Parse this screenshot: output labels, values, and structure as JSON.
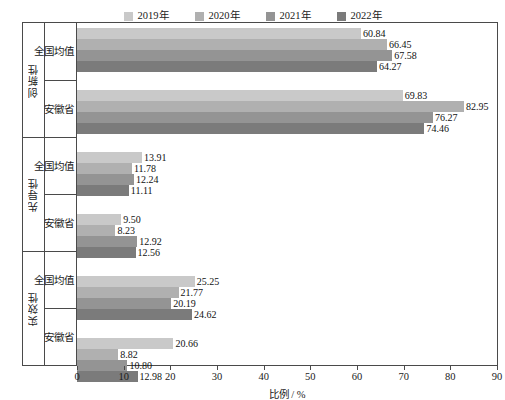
{
  "legend": {
    "items": [
      {
        "label": "2019年",
        "color": "#c9c9c9"
      },
      {
        "label": "2020年",
        "color": "#b0b0b0"
      },
      {
        "label": "2021年",
        "color": "#949494"
      },
      {
        "label": "2022年",
        "color": "#7b7b7b"
      }
    ]
  },
  "axes": {
    "xlabel": "比例 / %",
    "xticks": [
      "0",
      "10",
      "20",
      "30",
      "40",
      "50",
      "60",
      "70",
      "80",
      "90"
    ]
  },
  "groups": [
    {
      "name": "创新性",
      "rows": [
        {
          "name": "全国均值",
          "values": [
            "60.84",
            "66.45",
            "67.58",
            "64.27"
          ]
        },
        {
          "name": "安徽省",
          "values": [
            "69.83",
            "82.95",
            "76.27",
            "74.46"
          ]
        }
      ]
    },
    {
      "name": "先导性",
      "rows": [
        {
          "name": "全国均值",
          "values": [
            "13.91",
            "11.78",
            "12.24",
            "11.11"
          ]
        },
        {
          "name": "安徽省",
          "values": [
            "9.50",
            "8.23",
            "12.92",
            "12.56"
          ]
        }
      ]
    },
    {
      "name": "实效性",
      "rows": [
        {
          "name": "全国均值",
          "values": [
            "25.25",
            "21.77",
            "20.19",
            "24.62"
          ]
        },
        {
          "name": "安徽省",
          "values": [
            "20.66",
            "8.82",
            "10.80",
            "12.98"
          ]
        }
      ]
    }
  ],
  "chart_data": {
    "type": "bar",
    "orientation": "horizontal",
    "title": "",
    "xlabel": "比例 / %",
    "ylabel": "",
    "xlim": [
      0,
      90
    ],
    "xticks": [
      0,
      10,
      20,
      30,
      40,
      50,
      60,
      70,
      80,
      90
    ],
    "grid": false,
    "legend_position": "top-center",
    "categories": [
      "创新性 / 全国均值",
      "创新性 / 安徽省",
      "先导性 / 全国均值",
      "先导性 / 安徽省",
      "实效性 / 全国均值",
      "实效性 / 安徽省"
    ],
    "series": [
      {
        "name": "2019年",
        "color": "#c9c9c9",
        "values": [
          60.84,
          69.83,
          13.91,
          9.5,
          25.25,
          20.66
        ]
      },
      {
        "name": "2020年",
        "color": "#b0b0b0",
        "values": [
          66.45,
          82.95,
          11.78,
          8.23,
          21.77,
          8.82
        ]
      },
      {
        "name": "2021年",
        "color": "#949494",
        "values": [
          67.58,
          76.27,
          12.24,
          12.92,
          20.19,
          10.8
        ]
      },
      {
        "name": "2022年",
        "color": "#7b7b7b",
        "values": [
          64.27,
          74.46,
          11.11,
          12.56,
          24.62,
          12.98
        ]
      }
    ]
  }
}
